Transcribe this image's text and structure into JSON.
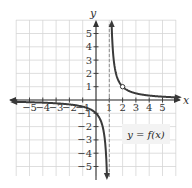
{
  "chart_data": {
    "type": "line",
    "title": "",
    "xlabel": "x",
    "ylabel": "y",
    "xlim": [
      -6,
      6
    ],
    "ylim": [
      -6,
      6
    ],
    "grid": true,
    "x_ticks": [
      -5,
      -4,
      -3,
      -2,
      -1,
      1,
      2,
      3,
      4,
      5
    ],
    "y_ticks": [
      -5,
      -4,
      -3,
      -2,
      -1,
      1,
      2,
      3,
      4,
      5
    ],
    "x_tick_labels": [
      "−5",
      "−4",
      "−3",
      "−2",
      "−1",
      "1",
      "2",
      "3",
      "4",
      "5"
    ],
    "y_tick_labels": [
      "−5",
      "−4",
      "−3",
      "−2",
      "−1",
      "1",
      "2",
      "3",
      "4",
      "5"
    ],
    "vertical_asymptote": {
      "x": 1,
      "style": "dashed"
    },
    "horizontal_asymptote": {
      "y": 0
    },
    "series": [
      {
        "name": "y = f(x)",
        "function": "1/(x-1)",
        "branches": [
          {
            "x_range": [
              -6,
              0.82
            ],
            "points": [
              [
                -6,
                -0.14
              ],
              [
                -5,
                -0.17
              ],
              [
                -4,
                -0.2
              ],
              [
                -3,
                -0.25
              ],
              [
                -2,
                -0.33
              ],
              [
                -1,
                -0.5
              ],
              [
                0,
                -1
              ],
              [
                0.5,
                -2
              ],
              [
                0.75,
                -4
              ],
              [
                0.82,
                -5.5
              ]
            ]
          },
          {
            "x_range": [
              1.18,
              6
            ],
            "points": [
              [
                1.18,
                5.5
              ],
              [
                1.25,
                4
              ],
              [
                1.5,
                2
              ],
              [
                2,
                1
              ],
              [
                3,
                0.5
              ],
              [
                4,
                0.33
              ],
              [
                5,
                0.25
              ],
              [
                6,
                0.2
              ]
            ]
          }
        ],
        "open_points": [
          [
            2,
            1
          ]
        ]
      }
    ],
    "legend": {
      "text": "y = f(x)",
      "position": "lower-right"
    }
  },
  "labels": {
    "x_axis": "x",
    "y_axis": "y",
    "legend": "y = f(x)"
  }
}
